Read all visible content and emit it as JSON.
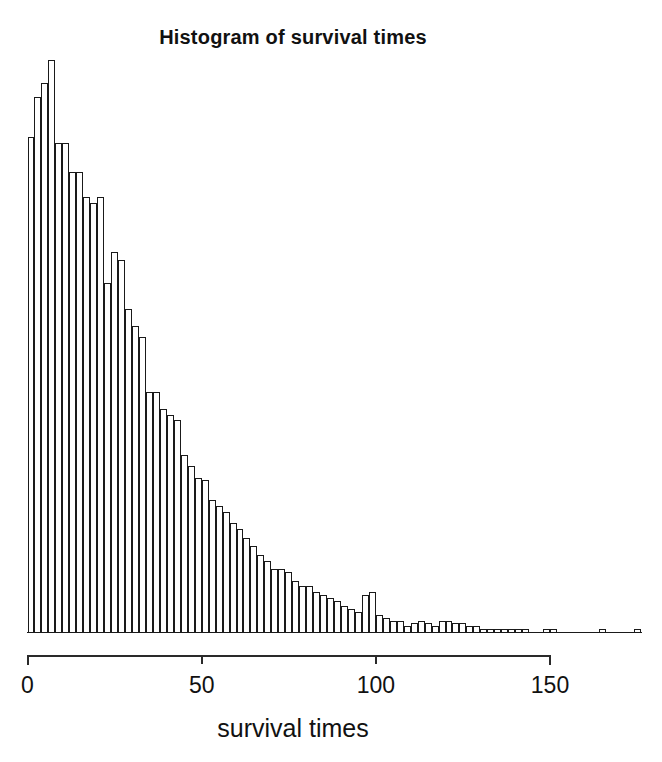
{
  "chart_data": {
    "type": "bar",
    "subtype": "histogram",
    "title": "Histogram of survival times",
    "xlabel": "survival times",
    "ylabel": "",
    "xlim": [
      0,
      176
    ],
    "ylim": [
      0,
      200
    ],
    "xticks": [
      0,
      50,
      100,
      150
    ],
    "xtick_labels": [
      "0",
      "50",
      "100",
      "150"
    ],
    "yticks": [],
    "ytick_labels": [],
    "grid": false,
    "legend": null,
    "bin_width": 2,
    "bin_starts": [
      0,
      2,
      4,
      6,
      8,
      10,
      12,
      14,
      16,
      18,
      20,
      22,
      24,
      26,
      28,
      30,
      32,
      34,
      36,
      38,
      40,
      42,
      44,
      46,
      48,
      50,
      52,
      54,
      56,
      58,
      60,
      62,
      64,
      66,
      68,
      70,
      72,
      74,
      76,
      78,
      80,
      82,
      84,
      86,
      88,
      90,
      92,
      94,
      96,
      98,
      100,
      102,
      104,
      106,
      108,
      110,
      112,
      114,
      116,
      118,
      120,
      122,
      124,
      126,
      128,
      130,
      132,
      134,
      136,
      138,
      140,
      142,
      144,
      146,
      148,
      150,
      152,
      154,
      156,
      158,
      160,
      162,
      164,
      166,
      168,
      170,
      172,
      174
    ],
    "categories": [
      "0-2",
      "2-4",
      "4-6",
      "6-8",
      "8-10",
      "10-12",
      "12-14",
      "14-16",
      "16-18",
      "18-20",
      "20-22",
      "22-24",
      "24-26",
      "26-28",
      "28-30",
      "30-32",
      "32-34",
      "34-36",
      "36-38",
      "38-40",
      "40-42",
      "42-44",
      "44-46",
      "46-48",
      "48-50",
      "50-52",
      "52-54",
      "54-56",
      "56-58",
      "58-60",
      "60-62",
      "62-64",
      "64-66",
      "66-68",
      "68-70",
      "70-72",
      "72-74",
      "74-76",
      "76-78",
      "78-80",
      "80-82",
      "82-84",
      "84-86",
      "86-88",
      "88-90",
      "90-92",
      "92-94",
      "94-96",
      "96-98",
      "98-100",
      "100-102",
      "102-104",
      "104-106",
      "106-108",
      "108-110",
      "110-112",
      "112-114",
      "114-116",
      "116-118",
      "118-120",
      "120-122",
      "122-124",
      "124-126",
      "126-128",
      "128-130",
      "130-132",
      "132-134",
      "134-136",
      "136-138",
      "138-140",
      "140-142",
      "142-144",
      "144-146",
      "146-148",
      "148-150",
      "150-152",
      "152-154",
      "154-156",
      "156-158",
      "158-160",
      "160-162",
      "162-164",
      "164-166",
      "166-168",
      "168-170",
      "170-172",
      "172-174",
      "174-176"
    ],
    "values": [
      173,
      187,
      192,
      200,
      171,
      171,
      161,
      161,
      152,
      150,
      152,
      122,
      133,
      130,
      113,
      107,
      103,
      84,
      84,
      78,
      76,
      74,
      62,
      58,
      54,
      53,
      46,
      44,
      42,
      38,
      36,
      33,
      30,
      27,
      25,
      22,
      22,
      21,
      18,
      16,
      16,
      14,
      13,
      12,
      11,
      9,
      8,
      7,
      13,
      14,
      6,
      5,
      4,
      4,
      2,
      3,
      4,
      3,
      2,
      4,
      4,
      3,
      3,
      2,
      2,
      1,
      1,
      1,
      1,
      1,
      1,
      1,
      0,
      0,
      1,
      1,
      0,
      0,
      0,
      0,
      0,
      0,
      1,
      0,
      0,
      0,
      0,
      1
    ]
  },
  "plot": {
    "axis_tick_names": [
      "x-tick-0",
      "x-tick-50",
      "x-tick-100",
      "x-tick-150"
    ]
  }
}
